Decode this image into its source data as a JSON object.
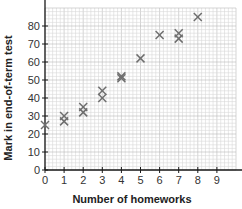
{
  "chart_data": {
    "type": "scatter",
    "title": "",
    "xlabel": "Number of homeworks",
    "ylabel": "Mark in end-of-term test",
    "xlim": [
      0,
      10
    ],
    "ylim": [
      0,
      90
    ],
    "x_ticks": [
      0,
      1,
      2,
      3,
      4,
      5,
      6,
      7,
      8,
      9
    ],
    "y_ticks": [
      0,
      10,
      20,
      30,
      40,
      50,
      60,
      70,
      80
    ],
    "grid": true,
    "marker": "cross",
    "series": [
      {
        "name": "students",
        "points": [
          [
            0,
            25
          ],
          [
            1,
            27
          ],
          [
            1,
            30
          ],
          [
            2,
            32
          ],
          [
            2,
            35
          ],
          [
            3,
            40
          ],
          [
            3,
            44
          ],
          [
            4,
            51
          ],
          [
            4,
            52
          ],
          [
            5,
            62
          ],
          [
            6,
            75
          ],
          [
            7,
            73
          ],
          [
            7,
            76
          ],
          [
            8,
            85
          ]
        ]
      }
    ]
  },
  "colors": {
    "axis": "#1a1a1a",
    "grid_minor": "#d8d8d8",
    "grid_major": "#b8b8b8",
    "marker": "#6e6e6e",
    "text": "#333333"
  }
}
